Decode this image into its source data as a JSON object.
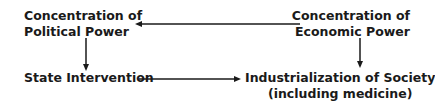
{
  "diagram": {
    "nodes": [
      {
        "id": "political",
        "lines": [
          "Concentration of",
          "Political Power"
        ]
      },
      {
        "id": "economic",
        "lines": [
          "Concentration of",
          "Economic Power"
        ]
      },
      {
        "id": "state",
        "lines": [
          "State Intervention"
        ]
      },
      {
        "id": "industrial",
        "lines": [
          "Industrialization of Society",
          "(including medicine)"
        ]
      }
    ],
    "edges": [
      {
        "from": "economic",
        "to": "political"
      },
      {
        "from": "political",
        "to": "state"
      },
      {
        "from": "state",
        "to": "industrial"
      },
      {
        "from": "economic",
        "to": "industrial"
      }
    ]
  }
}
